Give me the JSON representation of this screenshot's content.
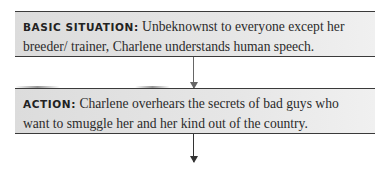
{
  "diagram": {
    "steps": [
      {
        "label": "BASIC SITUATION:",
        "text": "Unbeknownst to everyone except her breeder/ trainer, Charlene understands human speech."
      },
      {
        "label": "ACTION:",
        "text": "Charlene overhears the secrets of bad guys who want to smuggle her and her kind out of the country."
      }
    ],
    "connectors": [
      "arrow-down",
      "arrow-down"
    ]
  }
}
